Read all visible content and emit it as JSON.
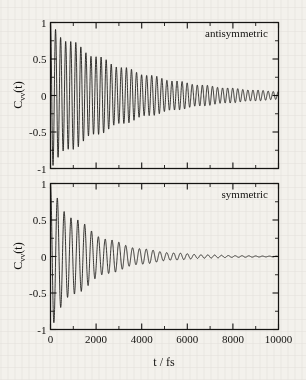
{
  "figure": {
    "background_color": "#f3f1ec",
    "ink_color": "#141311",
    "x_axis_title": "t / fs",
    "y_axis_label_main": "C",
    "y_axis_label_sub": "vv",
    "y_axis_label_tail": "(t)"
  },
  "chart_data": [
    {
      "type": "line",
      "panel": "top",
      "title": "",
      "annotation": "antisymmetric",
      "xlabel": "",
      "ylabel": "Cvv(t)",
      "xlim": [
        0,
        10000
      ],
      "ylim": [
        -1,
        1
      ],
      "xticks": [
        0,
        2000,
        4000,
        6000,
        8000,
        10000
      ],
      "xticklabels": [
        "",
        "",
        "",
        "",
        "",
        ""
      ],
      "xminor_step": 1000,
      "yticks": [
        -1,
        -0.5,
        0,
        0.5,
        1
      ],
      "yticklabels": [
        "-1",
        "-0.5",
        "0",
        "0.5",
        "1"
      ],
      "yminor_step": 0.25,
      "grid": false,
      "legend": false,
      "series": [
        {
          "name": "antisymmetric stretch velocity autocorrelation",
          "model": "damped_cosine_with_beat",
          "amplitude": 1.0,
          "period_fs": 222,
          "decay_tau_fs": 3500,
          "beat_period_fs": 1150,
          "beat_depth": 0.11,
          "phase_deg": 0,
          "baseline": 0.0,
          "n_points": 2400,
          "description": "C_vv(t) starts at 1, oscillates with ~222 fs period, envelope decays slowly; residual oscillation amplitude ~0.04 still visible at 10000 fs"
        }
      ]
    },
    {
      "type": "line",
      "panel": "bottom",
      "title": "",
      "annotation": "symmetric",
      "xlabel": "t / fs",
      "ylabel": "Cvv(t)",
      "xlim": [
        0,
        10000
      ],
      "ylim": [
        -1,
        1
      ],
      "xticks": [
        0,
        2000,
        4000,
        6000,
        8000,
        10000
      ],
      "xticklabels": [
        "0",
        "2000",
        "4000",
        "6000",
        "8000",
        "10000"
      ],
      "xminor_step": 1000,
      "yticks": [
        -1,
        -0.5,
        0,
        0.5,
        1
      ],
      "yticklabels": [
        "-1",
        "-0.5",
        "0",
        "0.5",
        "1"
      ],
      "yminor_step": 0.25,
      "grid": false,
      "legend": false,
      "series": [
        {
          "name": "symmetric stretch velocity autocorrelation",
          "model": "damped_cosine_with_beat",
          "amplitude": 1.0,
          "period_fs": 300,
          "decay_tau_fs": 1850,
          "beat_period_fs": 1450,
          "beat_depth": 0.16,
          "phase_deg": 0,
          "baseline": 0.0,
          "n_points": 2400,
          "description": "C_vv(t) starts at 1, oscillates with ~300 fs period, envelope decays faster than the antisymmetric case; essentially flat near zero beyond ~7000 fs"
        }
      ]
    }
  ]
}
